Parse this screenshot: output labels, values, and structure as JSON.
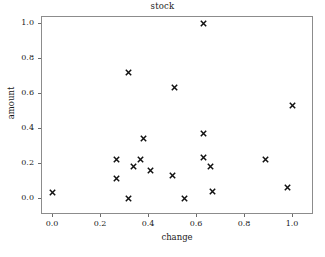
{
  "chart_data": {
    "type": "scatter",
    "title": "stock",
    "xlabel": "change",
    "ylabel": "amount",
    "xlim": [
      -0.05,
      1.08
    ],
    "ylim": [
      -0.05,
      1.06
    ],
    "grid": false,
    "legend": null,
    "marker": "x",
    "marker_color": "#111111",
    "frame_color": "#8c8c8c",
    "background_color": "#ffffff",
    "xticks": [
      "0.0",
      "0.2",
      "0.4",
      "0.6",
      "0.8",
      "1.0"
    ],
    "xtick_values": [
      0.0,
      0.2,
      0.4,
      0.6,
      0.8,
      1.0
    ],
    "yticks": [
      "0.0",
      "0.2",
      "0.4",
      "0.6",
      "0.8",
      "1.0"
    ],
    "ytick_values": [
      0.0,
      0.2,
      0.4,
      0.6,
      0.8,
      1.0
    ],
    "points": [
      {
        "x": 0.0,
        "y": 0.03
      },
      {
        "x": 0.27,
        "y": 0.22
      },
      {
        "x": 0.27,
        "y": 0.11
      },
      {
        "x": 0.32,
        "y": 0.72
      },
      {
        "x": 0.32,
        "y": 0.0
      },
      {
        "x": 0.34,
        "y": 0.18
      },
      {
        "x": 0.37,
        "y": 0.22
      },
      {
        "x": 0.38,
        "y": 0.34
      },
      {
        "x": 0.41,
        "y": 0.16
      },
      {
        "x": 0.5,
        "y": 0.13
      },
      {
        "x": 0.51,
        "y": 0.63
      },
      {
        "x": 0.55,
        "y": 0.0
      },
      {
        "x": 0.63,
        "y": 1.0
      },
      {
        "x": 0.63,
        "y": 0.37
      },
      {
        "x": 0.63,
        "y": 0.23
      },
      {
        "x": 0.66,
        "y": 0.18
      },
      {
        "x": 0.67,
        "y": 0.04
      },
      {
        "x": 0.89,
        "y": 0.22
      },
      {
        "x": 0.98,
        "y": 0.06
      },
      {
        "x": 1.0,
        "y": 0.53
      }
    ]
  }
}
